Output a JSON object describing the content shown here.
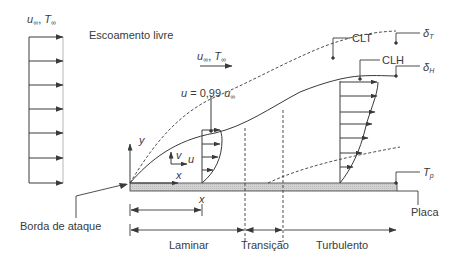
{
  "diagram": {
    "labels": {
      "free_stream_top": {
        "u": "u",
        "u_sub": "∞",
        "sep": ", ",
        "T": "T",
        "T_sub": "∞"
      },
      "free_stream_middle": {
        "u": "u",
        "u_sub": "∞",
        "sep": ", ",
        "T": "T",
        "T_sub": "∞"
      },
      "escoamento_livre": "Escoamento livre",
      "u_099": {
        "prefix": "u",
        "eq": " = 0,99 ",
        "u": "u",
        "u_sub": "∞"
      },
      "clt": "CLT",
      "clh": "CLH",
      "delta_t": {
        "sym": "δ",
        "sub": "T"
      },
      "delta_h": {
        "sym": "δ",
        "sub": "H"
      },
      "tp": {
        "sym": "T",
        "sub": "p"
      },
      "placa": "Placa",
      "borda_de_ataque": "Borda de ataque",
      "axis_y": "y",
      "axis_x": "x",
      "vel_v": "v",
      "vel_u": "u",
      "dim_x": "x",
      "regions": [
        "Laminar",
        "Transição",
        "Turbulento"
      ]
    },
    "colors": {
      "line": "#3a3a3a",
      "plate_fill": "#cfcfcf",
      "background": "#ffffff"
    }
  }
}
